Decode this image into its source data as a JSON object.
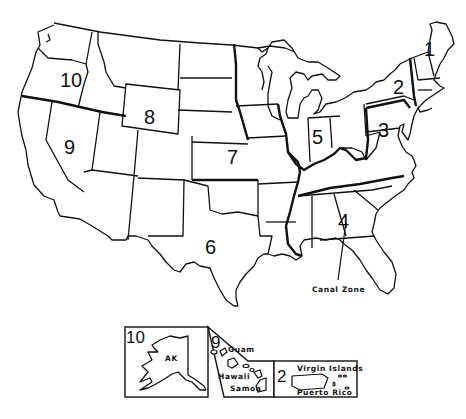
{
  "map": {
    "subject": "United States federal regions",
    "regions": [
      {
        "id": 1,
        "label": "1"
      },
      {
        "id": 2,
        "label": "2"
      },
      {
        "id": 3,
        "label": "3"
      },
      {
        "id": 4,
        "label": "4"
      },
      {
        "id": 5,
        "label": "5"
      },
      {
        "id": 6,
        "label": "6"
      },
      {
        "id": 7,
        "label": "7"
      },
      {
        "id": 8,
        "label": "8"
      },
      {
        "id": 9,
        "label": "9"
      },
      {
        "id": 10,
        "label": "10"
      }
    ],
    "annotations": {
      "canal_zone": "Canal Zone"
    },
    "insets": {
      "alaska": {
        "region_label": "10",
        "state_label": "AK"
      },
      "pacific": {
        "region_label": "9",
        "guam": "Guam",
        "hawaii": "Hawaii",
        "samoa": "Samoa"
      },
      "caribbean": {
        "region_label": "2",
        "virgin_islands": "Virgin Islands",
        "puerto_rico": "Puerto Rico"
      }
    }
  }
}
